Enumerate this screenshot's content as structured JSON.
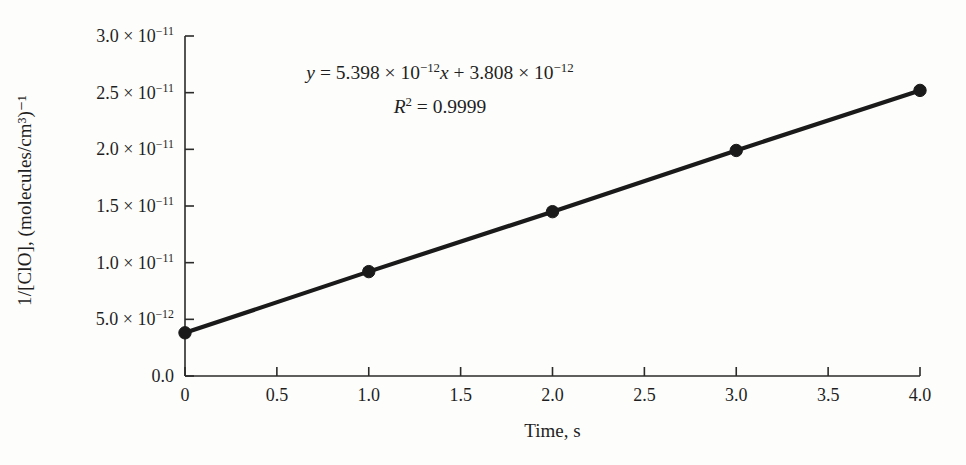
{
  "figure": {
    "background_color": "#fdfdfb",
    "ink_color": "#1a1a1a"
  },
  "axes": {
    "y_title": "1/[ClO], (molecules/cm³)⁻¹",
    "x_title": "Time, s"
  },
  "annotation": {
    "equation": "y = 5.398 × 10⁻¹²x + 3.808 × 10⁻¹²",
    "equation_parts": {
      "y": "y",
      "equals": "=",
      "slope_mantissa": "5.398",
      "times": "×",
      "ten": "10",
      "slope_exponent": "−12",
      "x_var": "x",
      "plus": "+",
      "intercept_mantissa": "3.808",
      "intercept_exponent": "−12"
    },
    "r_squared_label": "R",
    "r_squared_sup": "2",
    "r_squared_equals": "=",
    "r_squared_value": "0.9999"
  },
  "chart_data": {
    "type": "line",
    "title": "",
    "subtitle": "",
    "xlabel": "Time, s",
    "ylabel": "1/[ClO], (molecules/cm³)⁻¹",
    "x": [
      0,
      1.0,
      2.0,
      3.0,
      4.0
    ],
    "y": [
      3.81e-12,
      9.21e-12,
      1.45e-11,
      1.99e-11,
      2.52e-11
    ],
    "y_display": [
      "3.81 × 10⁻¹²",
      "9.21 × 10⁻¹²",
      "1.45 × 10⁻¹¹",
      "1.99 × 10⁻¹¹",
      "2.52 × 10⁻¹¹"
    ],
    "series": [
      {
        "name": "1/[ClO] vs time",
        "values": [
          3.81e-12,
          9.21e-12,
          1.45e-11,
          1.99e-11,
          2.52e-11
        ],
        "marker": "filled-circle",
        "color": "#1a1a1a",
        "line_width_px": 4
      }
    ],
    "fit": {
      "type": "linear",
      "slope": 5.398e-12,
      "intercept": 3.808e-12,
      "r_squared": 0.9999,
      "equation_text": "y = 5.398 × 10⁻¹²x + 3.808 × 10⁻¹²"
    },
    "xlim": [
      0,
      4.0
    ],
    "ylim": [
      0,
      3e-11
    ],
    "grid": false,
    "legend": false,
    "legend_position": "none",
    "x_ticks": [
      {
        "value": 0,
        "label": "0"
      },
      {
        "value": 0.5,
        "label": "0.5"
      },
      {
        "value": 1.0,
        "label": "1.0"
      },
      {
        "value": 1.5,
        "label": "1.5"
      },
      {
        "value": 2.0,
        "label": "2.0"
      },
      {
        "value": 2.5,
        "label": "2.5"
      },
      {
        "value": 3.0,
        "label": "3.0"
      },
      {
        "value": 3.5,
        "label": "3.5"
      },
      {
        "value": 4.0,
        "label": "4.0"
      }
    ],
    "y_ticks": [
      {
        "value": 3e-11,
        "mantissa": "3.0",
        "times": "×",
        "base": "10",
        "exponent": "−11"
      },
      {
        "value": 2.5e-11,
        "mantissa": "2.5",
        "times": "×",
        "base": "10",
        "exponent": "−11"
      },
      {
        "value": 2e-11,
        "mantissa": "2.0",
        "times": "×",
        "base": "10",
        "exponent": "−11"
      },
      {
        "value": 1.5e-11,
        "mantissa": "1.5",
        "times": "×",
        "base": "10",
        "exponent": "−11"
      },
      {
        "value": 1e-11,
        "mantissa": "1.0",
        "times": "×",
        "base": "10",
        "exponent": "−11"
      },
      {
        "value": 5e-12,
        "mantissa": "5.0",
        "times": "×",
        "base": "10",
        "exponent": "−12"
      },
      {
        "value": 0,
        "mantissa": "0.0",
        "times": "",
        "base": "",
        "exponent": ""
      }
    ]
  },
  "geometry": {
    "plot_left_px": 185,
    "plot_right_px": 920,
    "plot_top_px": 36,
    "plot_bottom_px": 376
  }
}
